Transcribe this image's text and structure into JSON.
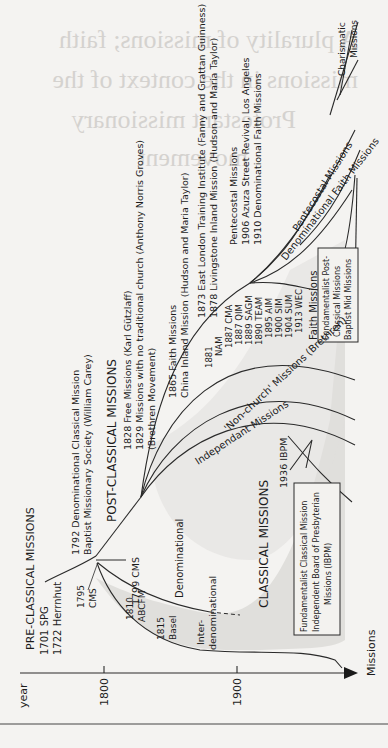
{
  "background_bleed": {
    "lines": [
      "A plurality of missions; faith",
      "missions in the context of the",
      "Protestant missionary",
      "movement"
    ]
  },
  "axis": {
    "y_label": "year",
    "x_label": "Missions",
    "ticks": [
      "1800",
      "1900"
    ]
  },
  "eras": {
    "pre_classical": {
      "title": "PRE-CLASSICAL MISSIONS",
      "items": [
        "1701 SPG",
        "1722 Herrnhut"
      ]
    },
    "classical": {
      "title": "CLASSICAL MISSIONS",
      "lead": [
        "1792 Denominational Classical Mission",
        "Baptist Missionary Society (William Carey)"
      ],
      "cms_1795": [
        "1795",
        "CMS"
      ],
      "cms_1799": "1799 CMS",
      "abcfm": [
        "1810",
        "ABCFM"
      ],
      "basel": [
        "1815",
        "Basel"
      ],
      "denominational": "Denominational",
      "interdenominational": [
        "Inter-",
        "denominational"
      ],
      "ibpm_year": "1936 IBPM",
      "fundamentalist_box": [
        "Fundamentalist Classical Mission",
        "Independent Board of Presbyterian",
        "Missions (IBPM)"
      ]
    },
    "post_classical": {
      "title": "POST-CLASSICAL MISSIONS",
      "items": [
        "1828 Free Missions (Karl Gützlaff)",
        "1829 Missions with no traditional church (Anthony Norris Groves)",
        "(Brethren Movement)"
      ],
      "faith_1865": [
        "1865 Faith Missions",
        "China Inland Mission (Hudson and Maria Taylor)"
      ],
      "faith_1873": [
        "1873 East London Training Institute (Fanny and Grattan Guinness)",
        "1878 Livingstone Inland Mission (Hudson and Maria Taylor)"
      ],
      "pentecostal_note": [
        "Pentecostal Missions",
        "1906 Azuza Street Revival, Los Angeles",
        "1910 Denominational Faith Missions"
      ],
      "faith_list": [
        "1881",
        "NAM",
        "1887 CMA",
        "1887 QIM",
        "1889 SAGM",
        "1890 TEAM",
        "1895 AIM",
        "1900 SIM",
        "1904 SUM",
        "1913 WEC"
      ],
      "faith_missions_label": "Faith Missions",
      "fundamentalist_post_box": [
        "Fundamentalist Post-",
        "Classical Missions",
        "Baptist Mid Missions"
      ]
    },
    "branches": {
      "non_church": "'Non-church' Missions (Brethren)",
      "independant": "Independant Missions",
      "pentecostal": "Pentecostal Missions",
      "denominational_faith": "Denominational Faith Missions",
      "charismatic": [
        "Charismatic",
        "Missions"
      ]
    }
  },
  "colors": {
    "background": "#f4f3f1",
    "ink": "#1c1c1c",
    "shade": "#e0dfdc",
    "bleed": "#d4d2cf"
  }
}
